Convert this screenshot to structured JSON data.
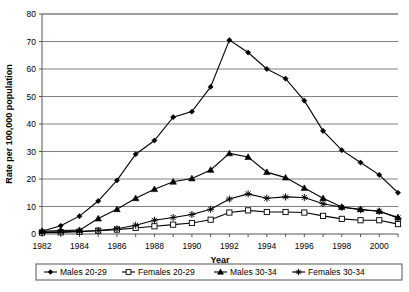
{
  "chart_data": {
    "type": "line",
    "title": "",
    "xlabel": "Year",
    "ylabel": "Rate per 100,000 population",
    "xlim": [
      1982,
      2001
    ],
    "ylim": [
      0,
      80
    ],
    "ytick_step": 10,
    "yticks": [
      0,
      10,
      20,
      30,
      40,
      50,
      60,
      70,
      80
    ],
    "xticks": [
      1982,
      1984,
      1986,
      1988,
      1990,
      1992,
      1994,
      1996,
      1998,
      2000
    ],
    "x": [
      1982,
      1983,
      1984,
      1985,
      1986,
      1987,
      1988,
      1989,
      1990,
      1991,
      1992,
      1993,
      1994,
      1995,
      1996,
      1997,
      1998,
      1999,
      2000,
      2001
    ],
    "grid": "horizontal",
    "legend_position": "bottom",
    "series": [
      {
        "name": "Males 20-29",
        "marker": "filled-diamond",
        "color": "#000000",
        "values": [
          1.0,
          3.0,
          6.5,
          12.0,
          19.5,
          29.0,
          34.0,
          42.5,
          44.5,
          53.5,
          70.5,
          66.0,
          60.0,
          56.5,
          48.5,
          37.5,
          30.5,
          26.0,
          21.5,
          15.0
        ]
      },
      {
        "name": "Females 20-29",
        "marker": "open-square",
        "color": "#000000",
        "values": [
          0.5,
          0.6,
          0.8,
          1.2,
          1.6,
          2.2,
          2.8,
          3.4,
          4.0,
          5.2,
          7.8,
          8.6,
          8.0,
          8.0,
          7.8,
          6.6,
          5.5,
          5.0,
          5.0,
          3.6
        ]
      },
      {
        "name": "Males 30-34",
        "marker": "filled-triangle",
        "color": "#000000",
        "values": [
          1.0,
          1.3,
          1.4,
          5.6,
          9.0,
          13.0,
          16.3,
          19.0,
          20.2,
          23.3,
          29.3,
          28.0,
          22.5,
          20.5,
          16.7,
          13.0,
          9.8,
          9.0,
          8.3,
          6.0
        ]
      },
      {
        "name": "Females 30-34",
        "marker": "filled-star",
        "color": "#000000",
        "values": [
          0.7,
          0.8,
          1.0,
          1.3,
          1.9,
          3.2,
          5.0,
          6.0,
          7.1,
          9.0,
          12.7,
          14.6,
          13.0,
          13.5,
          13.3,
          11.0,
          9.7,
          8.8,
          8.3,
          5.8
        ]
      }
    ]
  },
  "legend": {
    "items": [
      {
        "label": "Males 20-29"
      },
      {
        "label": "Females 20-29"
      },
      {
        "label": "Males 30-34"
      },
      {
        "label": "Females 30-34"
      }
    ]
  }
}
